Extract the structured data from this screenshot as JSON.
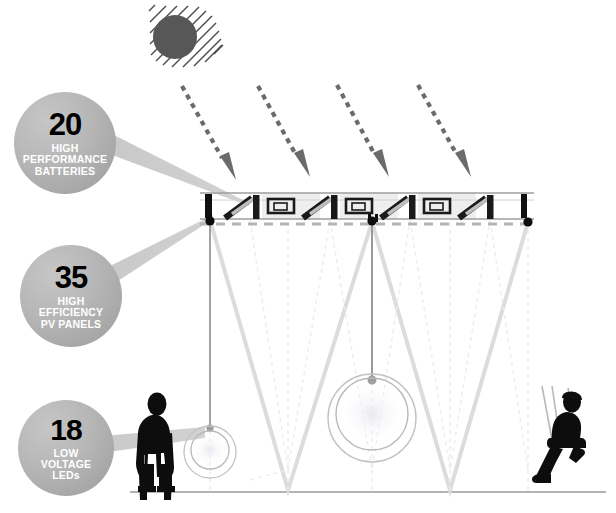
{
  "diagram": {
    "background_color": "#ffffff",
    "ground_line_color": "#9a9a9a"
  },
  "callouts": [
    {
      "id": "batteries",
      "number": "20",
      "label": "HIGH\nPERFORMANCE\nBATTERIES",
      "label_lines": [
        "HIGH",
        "PERFORMANCE",
        "BATTERIES"
      ],
      "fill_color": "#b4b4b4",
      "number_color": "#000000",
      "label_color": "#ffffff"
    },
    {
      "id": "panels",
      "number": "35",
      "label": "HIGH\nEFFICIENCY\nPV PANELS",
      "label_lines": [
        "HIGH",
        "EFFICIENCY",
        "PV PANELS"
      ],
      "fill_color": "#b4b4b4",
      "number_color": "#000000",
      "label_color": "#ffffff"
    },
    {
      "id": "leds",
      "number": "18",
      "label": "LOW\nVOLTAGE\nLEDs",
      "label_lines": [
        "LOW",
        "VOLTAGE",
        "LEDs"
      ],
      "fill_color": "#b4b4b4",
      "number_color": "#000000",
      "label_color": "#ffffff"
    }
  ],
  "scene": {
    "sun": {
      "name": "sun-icon",
      "color": "#575757",
      "ray_color": "#4a4a4a",
      "ray_count": 12
    },
    "sun_rays": {
      "name": "solar-irradiance-arrows",
      "count": 4,
      "style": "dashed",
      "color": "#6b6b6b",
      "direction": "down-right"
    },
    "canopy": {
      "name": "solar-panel-canopy",
      "module_count": 4,
      "frame_color": "#8e8e8e",
      "panel_mark_color": "#1a1a1a",
      "anchor_color": "#111111"
    },
    "cables": {
      "name": "tension-cable-network",
      "color": "#d8d8d8"
    },
    "lamps": [
      {
        "name": "pendant-lamp-small",
        "size": "small"
      },
      {
        "name": "pendant-lamp-large",
        "size": "large"
      }
    ],
    "figures": [
      {
        "name": "standing-person-silhouette",
        "color": "#0d0d0d"
      },
      {
        "name": "seated-person-on-swing-silhouette",
        "color": "#0d0d0d"
      }
    ],
    "leader_lines": {
      "name": "callout-leader-lines",
      "color": "#c2c2c2",
      "count": 3
    }
  }
}
